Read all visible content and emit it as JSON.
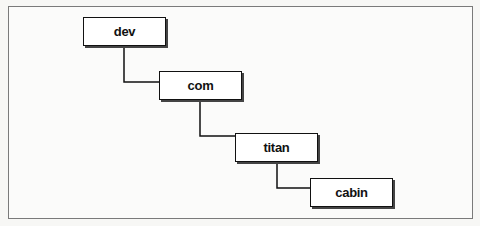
{
  "diagram": {
    "type": "hierarchy",
    "nodes": [
      {
        "id": "dev",
        "label": "dev",
        "level": 0
      },
      {
        "id": "com",
        "label": "com",
        "level": 1
      },
      {
        "id": "titan",
        "label": "titan",
        "level": 2
      },
      {
        "id": "cabin",
        "label": "cabin",
        "level": 3
      }
    ],
    "edges": [
      {
        "from": "dev",
        "to": "com"
      },
      {
        "from": "com",
        "to": "titan"
      },
      {
        "from": "titan",
        "to": "cabin"
      }
    ]
  },
  "colors": {
    "border": "#111111",
    "frame": "#7a7a7a",
    "background": "#fbfbfa"
  }
}
